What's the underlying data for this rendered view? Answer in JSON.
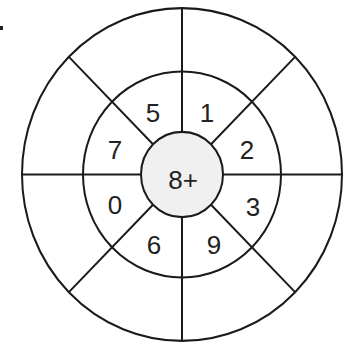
{
  "diagram": {
    "type": "concentric-wheel",
    "rings": 3,
    "sectors": 8,
    "center_label": "8+",
    "inner_ring_labels": [
      {
        "id": "ne-upper",
        "value": "1",
        "x": 207,
        "y": 113
      },
      {
        "id": "ne-lower",
        "value": "2",
        "x": 247,
        "y": 150
      },
      {
        "id": "se-upper",
        "value": "3",
        "x": 253,
        "y": 207
      },
      {
        "id": "se-lower",
        "value": "9",
        "x": 214,
        "y": 245
      },
      {
        "id": "sw-lower",
        "value": "6",
        "x": 154,
        "y": 245
      },
      {
        "id": "sw-upper",
        "value": "0",
        "x": 115,
        "y": 205
      },
      {
        "id": "nw-lower",
        "value": "7",
        "x": 115,
        "y": 150
      },
      {
        "id": "nw-upper",
        "value": "5",
        "x": 153,
        "y": 113
      }
    ],
    "outer_ring_labels": [],
    "colors": {
      "stroke": "#1a1a1a",
      "hub_fill": "#f0f0f0",
      "background": "#ffffff"
    }
  }
}
